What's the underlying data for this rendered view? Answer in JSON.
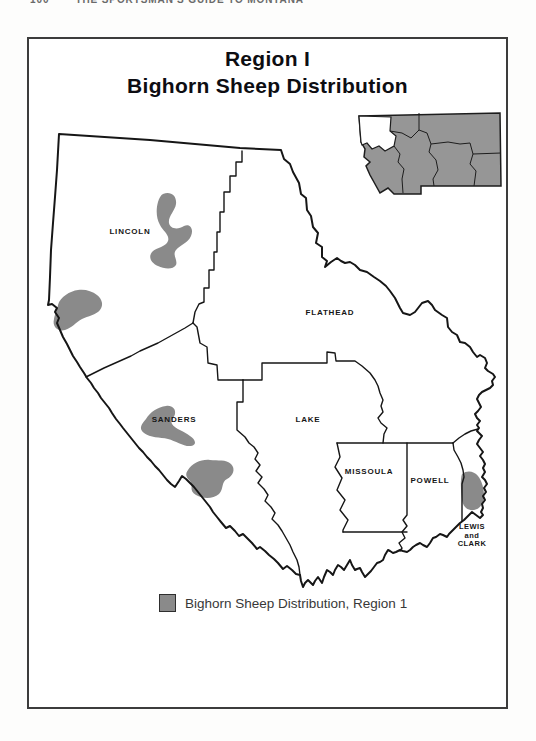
{
  "page": {
    "running_header": {
      "page_number": "100",
      "book_title": "THE SPORTSMAN'S GUIDE TO MONTANA"
    }
  },
  "map": {
    "title_line1": "Region I",
    "title_line2": "Bighorn Sheep Distribution",
    "region_shown": "Region 1 (northwest Montana)",
    "counties": [
      {
        "id": "lincoln",
        "label": "LINCOLN",
        "lines": [
          "LINCOLN"
        ]
      },
      {
        "id": "flathead",
        "label": "FLATHEAD",
        "lines": [
          "FLATHEAD"
        ]
      },
      {
        "id": "sanders",
        "label": "SANDERS",
        "lines": [
          "SANDERS"
        ]
      },
      {
        "id": "lake",
        "label": "LAKE",
        "lines": [
          "LAKE"
        ]
      },
      {
        "id": "missoula",
        "label": "MISSOULA",
        "lines": [
          "MISSOULA"
        ]
      },
      {
        "id": "powell",
        "label": "POWELL",
        "lines": [
          "POWELL"
        ]
      },
      {
        "id": "lewis-and-clark",
        "label": "LEWIS and CLARK",
        "lines": [
          "LEWIS",
          "and",
          "CLARK"
        ]
      }
    ],
    "distribution_areas": [
      {
        "county": "Lincoln",
        "approx_center_px": [
          172,
          230
        ]
      },
      {
        "county": "Lincoln/Sanders west border",
        "approx_center_px": [
          78,
          310
        ]
      },
      {
        "county": "Sanders",
        "approx_center_px": [
          168,
          425
        ]
      },
      {
        "county": "Sanders south / region boundary",
        "approx_center_px": [
          209,
          479
        ]
      },
      {
        "county": "Lewis and Clark west edge",
        "approx_center_px": [
          473,
          492
        ]
      }
    ],
    "legend": {
      "swatch_color": "#8a8a8a",
      "label": "Bighorn Sheep Distribution, Region 1"
    },
    "inset": {
      "description": "Montana FWP regions, Region 1 highlighted white",
      "fill": "#969696",
      "highlight_fill": "#ffffff"
    },
    "colors": {
      "distribution_fill": "#8a8a8a",
      "boundary": "#161616",
      "frame": "#3c3c3c"
    }
  }
}
